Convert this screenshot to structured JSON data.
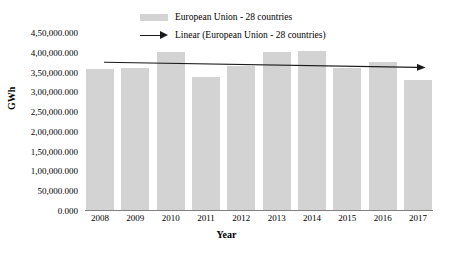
{
  "chart_data": {
    "type": "bar",
    "title": "",
    "xlabel": "Year",
    "ylabel": "GWh",
    "categories": [
      "2008",
      "2009",
      "2010",
      "2011",
      "2012",
      "2013",
      "2014",
      "2015",
      "2016",
      "2017"
    ],
    "series": [
      {
        "name": "European Union - 28 countries",
        "values": [
          35700000,
          36000000,
          40000000,
          33700000,
          36300000,
          39900000,
          40100000,
          35800000,
          37400000,
          32800000
        ],
        "color": "#d3d3d3"
      },
      {
        "name": "Linear (European Union - 28 countries)",
        "type": "trendline",
        "start_value": 37600000,
        "end_value": 36300000,
        "color": "#1a1a1a"
      }
    ],
    "ylim": [
      0,
      45000000
    ],
    "ytick_values": [
      0,
      5000000,
      10000000,
      15000000,
      20000000,
      25000000,
      30000000,
      35000000,
      40000000,
      45000000
    ],
    "ytick_labels": [
      "0.000",
      "50,000.000",
      "1,00,000.000",
      "1,50,000.000",
      "2,00,000.000",
      "2,50,000.000",
      "3,00,000.000",
      "3,50,000.000",
      "4,00,000.000",
      "4,50,000.000"
    ],
    "grid": false,
    "legend_position": "top-center"
  },
  "legend": {
    "items": [
      {
        "label": "European Union - 28 countries",
        "marker": "swatch"
      },
      {
        "label": "Linear (European Union - 28 countries)",
        "marker": "arrow-line"
      }
    ]
  },
  "axes": {
    "x_title": "Year",
    "y_title": "GWh"
  },
  "colors": {
    "bar": "#d3d3d3",
    "trendline": "#1a1a1a",
    "axis": "#808080",
    "text": "#000000",
    "background": "#ffffff"
  }
}
